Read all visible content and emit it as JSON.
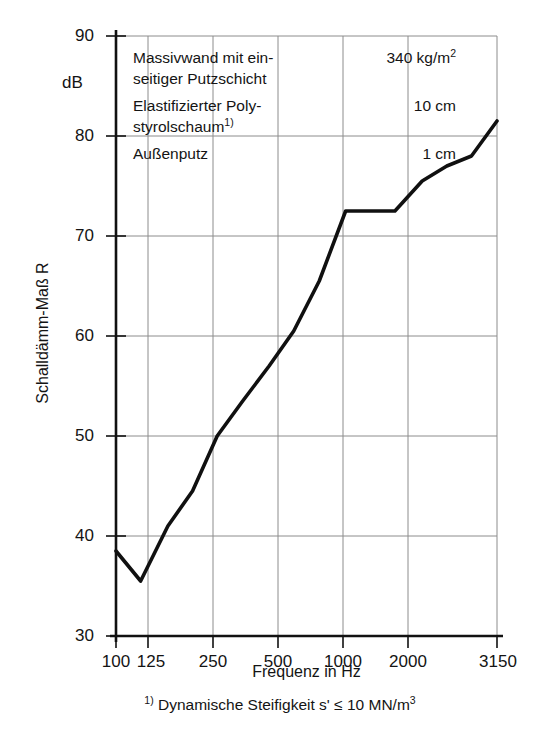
{
  "figure": {
    "y_axis_title": "Schalldämm-Maß R",
    "y_axis_unit": "dB",
    "x_axis_title": "Frequenz in  Hz",
    "footnote_marker": "1)",
    "footnote_text": "Dynamische Steifigkeit s' ≤ 10 MN/m",
    "footnote_exponent": "3"
  },
  "annotation": {
    "rows": [
      {
        "desc_line1": "Massivwand mit ein-",
        "desc_line2": "seitiger Putzschicht",
        "value": "340 kg/m",
        "value_exponent": "2",
        "marker": ""
      },
      {
        "desc_line1": "Elastifizierter Poly-",
        "desc_line2": "styrolschaum",
        "value": "10 cm",
        "value_exponent": "",
        "marker": "1)"
      },
      {
        "desc_line1": "Außenputz",
        "desc_line2": "",
        "value": "1 cm",
        "value_exponent": "",
        "marker": ""
      }
    ]
  },
  "chart_data": {
    "type": "line",
    "title": "",
    "xlabel": "Frequenz in  Hz",
    "ylabel": "Schalldämm-Maß R",
    "yunit": "dB",
    "xscale": "log",
    "xlim": [
      100,
      3150
    ],
    "ylim": [
      30,
      90
    ],
    "ytick_values": [
      30,
      40,
      50,
      60,
      70,
      80,
      90
    ],
    "ytick_labels": [
      "30",
      "40",
      "50",
      "60",
      "70",
      "80",
      "90"
    ],
    "xtick_values": [
      100,
      125,
      250,
      500,
      1000,
      2000,
      3150
    ],
    "xtick_labels": [
      "100",
      "125",
      "250",
      "500",
      "1000",
      "2000",
      "3150"
    ],
    "grid": true,
    "legend": "none",
    "series": [
      {
        "name": "R",
        "x": [
          100,
          125,
          160,
          200,
          250,
          315,
          400,
          500,
          630,
          800,
          1000,
          1250,
          1600,
          2000,
          2500,
          3150
        ],
        "y": [
          38.5,
          35.5,
          41.0,
          44.5,
          50.0,
          53.5,
          57.0,
          60.5,
          65.5,
          72.5,
          72.5,
          72.5,
          75.5,
          77.0,
          78.0,
          81.5
        ]
      }
    ]
  },
  "geometry": {
    "plot_left": 116,
    "plot_right": 497,
    "plot_top": 36,
    "plot_bottom": 636
  }
}
